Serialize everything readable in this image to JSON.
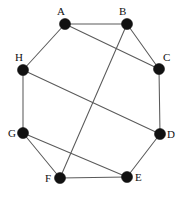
{
  "figure": {
    "name": "undirected-graph-diagram",
    "width": 183,
    "height": 197,
    "background_color": "#ffffff",
    "node_color": "#111111",
    "edge_color": "#5a5a5a",
    "label_color": "#111111",
    "node_radius": 5.5,
    "edge_width": 1.05
  },
  "chart_data": {
    "type": "diagram",
    "title": "",
    "xlabel": "",
    "ylabel": "",
    "graph_type": "undirected",
    "node_count": 8,
    "edge_count": 12,
    "nodes": [
      {
        "id": "A",
        "label": "A",
        "x": 65,
        "y": 24,
        "label_x": 57,
        "label_y": 6,
        "degree": 3
      },
      {
        "id": "B",
        "label": "B",
        "x": 127,
        "y": 24,
        "label_x": 119,
        "label_y": 6,
        "degree": 3
      },
      {
        "id": "C",
        "label": "C",
        "x": 159,
        "y": 69,
        "label_x": 163,
        "label_y": 52,
        "degree": 3
      },
      {
        "id": "D",
        "label": "D",
        "x": 160,
        "y": 134,
        "label_x": 167,
        "label_y": 129,
        "degree": 3
      },
      {
        "id": "E",
        "label": "E",
        "x": 127,
        "y": 177,
        "label_x": 135,
        "label_y": 172,
        "degree": 4
      },
      {
        "id": "F",
        "label": "F",
        "x": 60,
        "y": 178,
        "label_x": 45,
        "label_y": 173,
        "degree": 3
      },
      {
        "id": "G",
        "label": "G",
        "x": 23,
        "y": 133,
        "label_x": 8,
        "label_y": 128,
        "degree": 3
      },
      {
        "id": "H",
        "label": "H",
        "x": 23,
        "y": 70,
        "label_x": 15,
        "label_y": 52,
        "degree": 3
      }
    ],
    "edges": [
      {
        "from": "A",
        "to": "B"
      },
      {
        "from": "A",
        "to": "C"
      },
      {
        "from": "A",
        "to": "H"
      },
      {
        "from": "B",
        "to": "C"
      },
      {
        "from": "B",
        "to": "F"
      },
      {
        "from": "C",
        "to": "D"
      },
      {
        "from": "D",
        "to": "E"
      },
      {
        "from": "D",
        "to": "H"
      },
      {
        "from": "E",
        "to": "F"
      },
      {
        "from": "E",
        "to": "G"
      },
      {
        "from": "F",
        "to": "G"
      },
      {
        "from": "G",
        "to": "H"
      }
    ]
  }
}
